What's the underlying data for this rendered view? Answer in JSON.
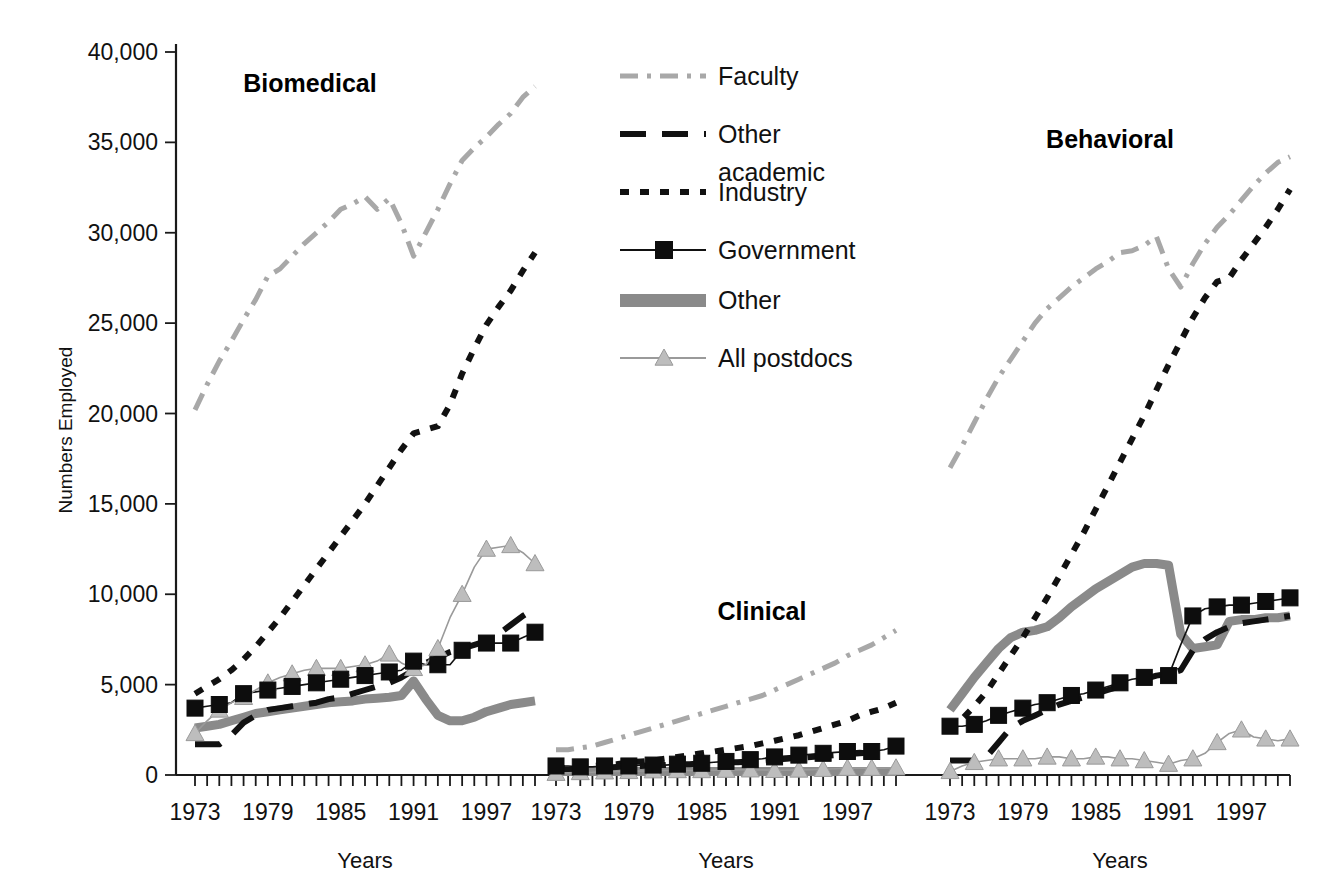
{
  "figure": {
    "ylabel": "Numbers Employed",
    "xlabel_1": "Years",
    "xlabel_2": "Years",
    "xlabel_3": "Years"
  },
  "legend": {
    "items": [
      {
        "label": "Faculty",
        "key": "faculty",
        "color": "#a8a8a8",
        "style": "dashdot",
        "width": 5,
        "marker": "none"
      },
      {
        "label": "Other academic",
        "key": "other_acad",
        "color": "#111111",
        "style": "longdash",
        "width": 6,
        "marker": "none"
      },
      {
        "label": "Industry",
        "key": "industry",
        "color": "#111111",
        "style": "dot",
        "width": 6,
        "marker": "none"
      },
      {
        "label": "Government",
        "key": "government",
        "color": "#111111",
        "style": "solid",
        "width": 1.6,
        "marker": "square"
      },
      {
        "label": "Other",
        "key": "other",
        "color": "#8a8a8a",
        "style": "solid",
        "width": 9,
        "marker": "none"
      },
      {
        "label": "All postdocs",
        "key": "postdocs",
        "color": "#9a9a9a",
        "style": "solid",
        "width": 1.6,
        "marker": "triangle"
      }
    ]
  },
  "chart_data": {
    "type": "line",
    "title": "",
    "xlabel": "Years",
    "ylabel": "Numbers Employed",
    "ylim": [
      0,
      40000
    ],
    "ytick_values": [
      0,
      5000,
      10000,
      15000,
      20000,
      25000,
      30000,
      35000,
      40000
    ],
    "ytick_labels": [
      "0",
      "5,000",
      "10,000",
      "15,000",
      "20,000",
      "25,000",
      "30,000",
      "35,000",
      "40,000"
    ],
    "xlim": [
      1973,
      2001
    ],
    "xtick_labels": [
      "1973",
      "1979",
      "1985",
      "1991",
      "1997"
    ],
    "xtick_label_years": [
      1973,
      1979,
      1985,
      1991,
      1997
    ],
    "grid": false,
    "legend_position": "top-center",
    "x": [
      1973,
      1974,
      1975,
      1976,
      1977,
      1978,
      1979,
      1980,
      1981,
      1982,
      1983,
      1984,
      1985,
      1986,
      1987,
      1988,
      1989,
      1990,
      1991,
      1992,
      1993,
      1994,
      1995,
      1996,
      1997,
      1998,
      1999,
      2000,
      2001
    ],
    "panels": [
      {
        "name": "Biomedical",
        "series": [
          {
            "name": "Faculty",
            "key": "faculty",
            "values": [
              20200,
              21600,
              22900,
              24000,
              25200,
              26300,
              27600,
              28000,
              28700,
              29400,
              30000,
              30600,
              31300,
              31600,
              32000,
              31300,
              31900,
              30500,
              28700,
              30000,
              31300,
              32700,
              34000,
              34700,
              35300,
              36000,
              36600,
              37500,
              38100
            ]
          },
          {
            "name": "Other academic",
            "key": "other_acad",
            "values": [
              1700,
              1700,
              1700,
              2200,
              2900,
              3300,
              3600,
              3700,
              3800,
              3900,
              4000,
              4200,
              4300,
              4500,
              4700,
              4900,
              5100,
              5400,
              5800,
              6200,
              6500,
              6800,
              7000,
              7200,
              7400,
              7800,
              8300,
              8800,
              9200
            ]
          },
          {
            "name": "Industry",
            "key": "industry",
            "values": [
              4500,
              4900,
              5300,
              5800,
              6400,
              7100,
              7900,
              8700,
              9600,
              10500,
              11400,
              12300,
              13200,
              14100,
              15000,
              16000,
              17000,
              18000,
              18900,
              19100,
              19300,
              20500,
              22200,
              23600,
              24900,
              25900,
              26800,
              27900,
              28900
            ]
          },
          {
            "name": "Government",
            "key": "government",
            "values": [
              3700,
              3800,
              3900,
              4000,
              4500,
              4600,
              4700,
              4800,
              4900,
              5000,
              5100,
              5200,
              5300,
              5400,
              5500,
              5600,
              5700,
              5800,
              6300,
              6100,
              6100,
              6100,
              6900,
              7200,
              7300,
              7300,
              7300,
              7600,
              7900
            ]
          },
          {
            "name": "Other",
            "key": "other",
            "values": [
              2600,
              2700,
              2800,
              3000,
              3200,
              3400,
              3500,
              3600,
              3700,
              3800,
              3900,
              4000,
              4050,
              4100,
              4200,
              4250,
              4300,
              4400,
              5200,
              4200,
              3300,
              3000,
              3000,
              3200,
              3500,
              3700,
              3900,
              4000,
              4100
            ]
          },
          {
            "name": "All postdocs",
            "key": "postdocs",
            "values": [
              2300,
              3000,
              3600,
              4000,
              4300,
              4700,
              5100,
              5400,
              5600,
              5800,
              5900,
              5900,
              5900,
              6000,
              6100,
              6300,
              6700,
              6200,
              5900,
              6100,
              7000,
              8700,
              10000,
              11500,
              12500,
              12600,
              12700,
              12300,
              11700
            ]
          }
        ]
      },
      {
        "name": "Clinical",
        "series": [
          {
            "name": "Faculty",
            "key": "faculty",
            "values": [
              1400,
              1400,
              1500,
              1600,
              1800,
              2000,
              2200,
              2400,
              2600,
              2800,
              3000,
              3200,
              3400,
              3600,
              3800,
              4000,
              4200,
              4400,
              4700,
              5000,
              5300,
              5600,
              5900,
              6200,
              6600,
              6900,
              7200,
              7600,
              8000
            ]
          },
          {
            "name": "Other academic",
            "key": "other_acad",
            "values": [
              300,
              300,
              300,
              350,
              400,
              450,
              500,
              500,
              550,
              550,
              600,
              600,
              650,
              650,
              700,
              700,
              750,
              800,
              850,
              900,
              950,
              1000,
              1050,
              1100,
              1150,
              1200,
              1250,
              1300,
              1350
            ]
          },
          {
            "name": "Industry",
            "key": "industry",
            "values": [
              350,
              400,
              450,
              500,
              550,
              600,
              700,
              750,
              800,
              900,
              1000,
              1100,
              1200,
              1300,
              1400,
              1500,
              1600,
              1750,
              1900,
              2050,
              2200,
              2400,
              2600,
              2800,
              3000,
              3300,
              3500,
              3700,
              4000
            ]
          },
          {
            "name": "Government",
            "key": "government",
            "values": [
              500,
              500,
              450,
              450,
              500,
              500,
              500,
              550,
              550,
              550,
              600,
              600,
              650,
              700,
              750,
              800,
              850,
              900,
              1000,
              1050,
              1100,
              1150,
              1200,
              1250,
              1300,
              1350,
              1300,
              1400,
              1600
            ]
          },
          {
            "name": "Other",
            "key": "other",
            "values": [
              200,
              200,
              200,
              200,
              200,
              200,
              200,
              200,
              200,
              200,
              200,
              200,
              200,
              200,
              200,
              200,
              200,
              200,
              200,
              200,
              200,
              200,
              200,
              200,
              200,
              200,
              200,
              200,
              200
            ]
          },
          {
            "name": "All postdocs",
            "key": "postdocs",
            "values": [
              100,
              120,
              140,
              150,
              180,
              200,
              200,
              220,
              240,
              250,
              250,
              250,
              250,
              260,
              270,
              280,
              290,
              280,
              260,
              260,
              280,
              300,
              320,
              350,
              380,
              380,
              380,
              380,
              400
            ]
          }
        ]
      },
      {
        "name": "Behavioral",
        "series": [
          {
            "name": "Faculty",
            "key": "faculty",
            "values": [
              17000,
              18200,
              19500,
              20800,
              22000,
              23000,
              24000,
              25000,
              25800,
              26400,
              27000,
              27500,
              28000,
              28400,
              28900,
              29000,
              29300,
              29800,
              28000,
              27000,
              28300,
              29400,
              30300,
              31000,
              31800,
              32600,
              33300,
              33900,
              34200
            ]
          },
          {
            "name": "Other academic",
            "key": "other_acad",
            "values": [
              800,
              800,
              800,
              1000,
              1800,
              2600,
              3000,
              3300,
              3600,
              3900,
              4100,
              4300,
              4500,
              4700,
              4900,
              5100,
              5300,
              5500,
              5600,
              5800,
              6900,
              7500,
              7900,
              8200,
              8400,
              8500,
              8600,
              8700,
              8800
            ]
          },
          {
            "name": "Industry",
            "key": "industry",
            "values": [
              2400,
              3100,
              3800,
              4600,
              5600,
              6600,
              7600,
              8700,
              9800,
              11000,
              12200,
              13400,
              14700,
              16000,
              17300,
              18600,
              19900,
              21300,
              22700,
              24000,
              25300,
              26400,
              27300,
              27500,
              28500,
              29400,
              30300,
              31300,
              32400
            ]
          },
          {
            "name": "Government",
            "key": "government",
            "values": [
              2700,
              2700,
              2800,
              3000,
              3300,
              3500,
              3700,
              3900,
              4000,
              4200,
              4400,
              4500,
              4700,
              4900,
              5100,
              5300,
              5400,
              5500,
              5500,
              7200,
              8800,
              9200,
              9300,
              9400,
              9400,
              9500,
              9600,
              9700,
              9800
            ]
          },
          {
            "name": "Other",
            "key": "other",
            "values": [
              3600,
              4500,
              5400,
              6200,
              7000,
              7600,
              7900,
              8000,
              8200,
              8700,
              9300,
              9800,
              10300,
              10700,
              11100,
              11500,
              11700,
              11700,
              11600,
              7800,
              7000,
              7100,
              7200,
              8500,
              8600,
              8600,
              8700,
              8700,
              8800
            ]
          },
          {
            "name": "All postdocs",
            "key": "postdocs",
            "values": [
              200,
              500,
              700,
              800,
              900,
              900,
              900,
              900,
              1000,
              1000,
              900,
              900,
              1000,
              1000,
              900,
              900,
              800,
              700,
              600,
              800,
              900,
              1200,
              1800,
              2300,
              2500,
              2100,
              2000,
              1900,
              2000
            ]
          }
        ]
      }
    ]
  }
}
